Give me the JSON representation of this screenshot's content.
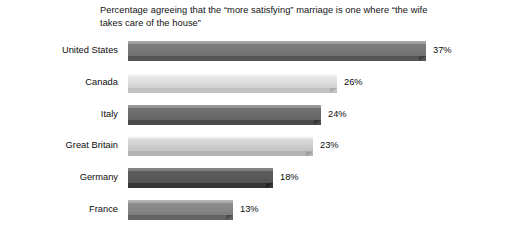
{
  "chart_data": {
    "type": "bar",
    "orientation": "horizontal",
    "title": "Percentage agreeing that the “more satisfying” marriage is one where “the wife takes care of the house”",
    "title_line1": "Percentage agreeing that the “more satisfying” marriage is one",
    "title_line2": "where “the wife takes care of the house”",
    "xlabel": "",
    "ylabel": "",
    "xlim": [
      0,
      40
    ],
    "grid": false,
    "legend": "none",
    "axis_visible": false,
    "value_suffix": "%",
    "categories": [
      "United States",
      "Canada",
      "Italy",
      "Great Britain",
      "Germany",
      "France"
    ],
    "values": [
      37,
      26,
      24,
      23,
      18,
      13
    ],
    "value_labels": [
      "37%",
      "26%",
      "24%",
      "23%",
      "18%",
      "13%"
    ],
    "bars": [
      {
        "category": "United States",
        "value": 37,
        "label": "37%",
        "top": "#9a9a9a",
        "body": "#777777",
        "bottom": "#555555",
        "chamfer": "#3f3f3f"
      },
      {
        "category": "Canada",
        "value": 26,
        "label": "26%",
        "top": "#efefef",
        "body": "#dcdcdc",
        "bottom": "#c2c2c2",
        "chamfer": "#ababab"
      },
      {
        "category": "Italy",
        "value": 24,
        "label": "24%",
        "top": "#8e8e8e",
        "body": "#6b6b6b",
        "bottom": "#4a4a4a",
        "chamfer": "#343434"
      },
      {
        "category": "Great Britain",
        "value": 23,
        "label": "23%",
        "top": "#e4e4e4",
        "body": "#cfcfcf",
        "bottom": "#b4b4b4",
        "chamfer": "#9c9c9c"
      },
      {
        "category": "Germany",
        "value": 18,
        "label": "18%",
        "top": "#7c7c7c",
        "body": "#585858",
        "bottom": "#363636",
        "chamfer": "#222222"
      },
      {
        "category": "France",
        "value": 13,
        "label": "13%",
        "top": "#a6a6a6",
        "body": "#858585",
        "bottom": "#636363",
        "chamfer": "#4c4c4c"
      }
    ]
  },
  "colors": {
    "background": "#ffffff",
    "text": "#0b0b0b"
  }
}
